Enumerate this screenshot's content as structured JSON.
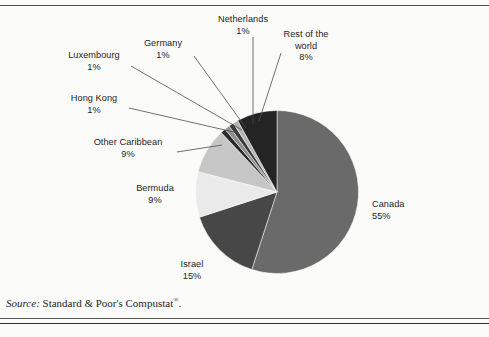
{
  "figure": {
    "background_color": "#fbfbfa",
    "rule_color": "#3a3a3a"
  },
  "source": {
    "prefix": "Source:",
    "text": "Standard & Poor's Compustat",
    "superscript": "®",
    "suffix": "."
  },
  "labels": [
    {
      "name": "netherlands",
      "title": "Netherlands",
      "pct": "1%"
    },
    {
      "name": "rest-of-world",
      "title": "Rest of the",
      "title2": "world",
      "pct": "8%"
    },
    {
      "name": "germany",
      "title": "Germany",
      "pct": "1%"
    },
    {
      "name": "luxembourg",
      "title": "Luxembourg",
      "pct": "1%"
    },
    {
      "name": "hong-kong",
      "title": "Hong Kong",
      "pct": "1%"
    },
    {
      "name": "other-caribbean",
      "title": "Other Caribbean",
      "pct": "9%"
    },
    {
      "name": "bermuda",
      "title": "Bermuda",
      "pct": "9%"
    },
    {
      "name": "israel",
      "title": "Israel",
      "pct": "15%"
    },
    {
      "name": "canada",
      "title": "Canada",
      "pct": "55%"
    }
  ],
  "chart_data": {
    "type": "pie",
    "title": "",
    "subtitle": "",
    "xlabel": "",
    "ylabel": "",
    "legend_position": "none",
    "grid": false,
    "total": 100,
    "unit": "percent",
    "start_angle_deg": 0,
    "direction": "clockwise",
    "categories": [
      "Canada",
      "Israel",
      "Bermuda",
      "Other Caribbean",
      "Hong Kong",
      "Luxembourg",
      "Germany",
      "Netherlands",
      "Rest of the world"
    ],
    "values": [
      55,
      15,
      9,
      9,
      1,
      1,
      1,
      1,
      8
    ],
    "slices": [
      {
        "label": "Canada",
        "value": 55,
        "display": "55%",
        "color": "#6a6a6a"
      },
      {
        "label": "Israel",
        "value": 15,
        "display": "15%",
        "color": "#474747"
      },
      {
        "label": "Bermuda",
        "value": 9,
        "display": "9%",
        "color": "#eaeaea"
      },
      {
        "label": "Other Caribbean",
        "value": 9,
        "display": "9%",
        "color": "#c6c6c6"
      },
      {
        "label": "Hong Kong",
        "value": 1,
        "display": "1%",
        "color": "#2a2a2a"
      },
      {
        "label": "Luxembourg",
        "value": 1,
        "display": "1%",
        "color": "#8e8e8e"
      },
      {
        "label": "Germany",
        "value": 1,
        "display": "1%",
        "color": "#3a3a3a"
      },
      {
        "label": "Netherlands",
        "value": 1,
        "display": "1%",
        "color": "#b4b4b4"
      },
      {
        "label": "Rest of the world",
        "value": 8,
        "display": "8%",
        "color": "#242424"
      }
    ]
  }
}
